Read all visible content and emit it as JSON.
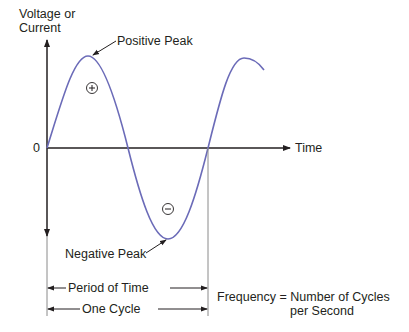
{
  "diagram": {
    "y_axis_label_line1": "Voltage or",
    "y_axis_label_line2": "Current",
    "x_axis_label": "Time",
    "origin_label": "0",
    "positive_peak_label": "Positive Peak",
    "negative_peak_label": "Negative Peak",
    "positive_symbol": "+",
    "negative_symbol": "−",
    "period_label": "Period of Time",
    "cycle_label": "One Cycle",
    "frequency_line1": "Frequency = Number of Cycles",
    "frequency_line2": "per Second",
    "colors": {
      "wave": "#6b6bb8",
      "axes": "#231f20",
      "guides": "#8a8a8a",
      "text": "#231f20"
    }
  }
}
